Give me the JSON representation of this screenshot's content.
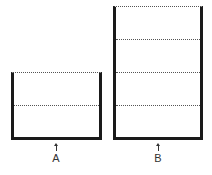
{
  "diagram": {
    "containers": [
      {
        "id": "A",
        "label": "A",
        "sections": 2
      },
      {
        "id": "B",
        "label": "B",
        "sections": 4
      }
    ],
    "colors": {
      "outline": "#1a1a1a",
      "divider": "#555555",
      "background": "#ffffff"
    }
  }
}
